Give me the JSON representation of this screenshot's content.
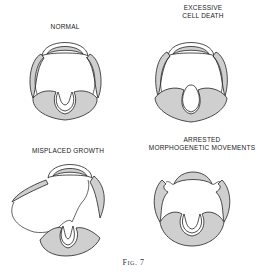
{
  "figure": {
    "caption": "Fig. 7",
    "panels": [
      {
        "id": "normal",
        "label_lines": [
          "NORMAL"
        ]
      },
      {
        "id": "excessive-cell-death",
        "label_lines": [
          "EXCESSIVE",
          "CELL DEATH"
        ]
      },
      {
        "id": "misplaced-growth",
        "label_lines": [
          "MISPLACED GROWTH"
        ]
      },
      {
        "id": "arrested-morphogenetic-movements",
        "label_lines": [
          "ARRESTED",
          "MORPHOGENETIC MOVEMENTS"
        ]
      }
    ],
    "colors": {
      "shading": "#cfcfcf",
      "outline": "#222222",
      "background": "#ffffff"
    }
  }
}
